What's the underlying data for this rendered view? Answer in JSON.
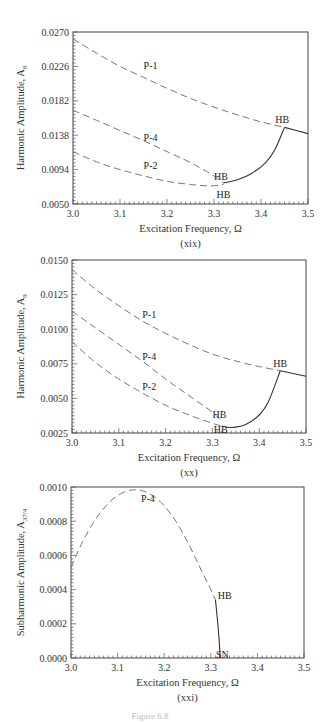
{
  "chart_data": [
    {
      "type": "line",
      "caption": "(xix)",
      "xlabel": "Excitation Frequency, Ω",
      "ylabel": "Harmonic Amplitude, A",
      "ylabel_sub": "8",
      "xlim": [
        3.0,
        3.5
      ],
      "ylim": [
        0.005,
        0.027
      ],
      "xticks": [
        "3.0",
        "3.1",
        "3.2",
        "3.3",
        "3.4",
        "3.5"
      ],
      "yticks": [
        "0.0270",
        "0.0226",
        "0.0182",
        "0.0138",
        "0.0094",
        "0.0050"
      ],
      "frame": {
        "x0": 73,
        "x1": 308,
        "y0": 32,
        "y1": 204
      },
      "series": [
        {
          "name": "P-1",
          "style": "dashed",
          "x": [
            3.0,
            3.05,
            3.1,
            3.15,
            3.2,
            3.25,
            3.3,
            3.35,
            3.4,
            3.45
          ],
          "y": [
            0.0261,
            0.0243,
            0.0226,
            0.0212,
            0.0198,
            0.0185,
            0.0174,
            0.0164,
            0.0155,
            0.0148
          ]
        },
        {
          "name": "P-1 stable",
          "style": "solid",
          "x": [
            3.45,
            3.5
          ],
          "y": [
            0.0148,
            0.014
          ]
        },
        {
          "name": "P-4",
          "style": "dashed",
          "x": [
            3.0,
            3.05,
            3.1,
            3.15,
            3.2,
            3.25,
            3.3,
            3.32
          ],
          "y": [
            0.017,
            0.0157,
            0.0144,
            0.0131,
            0.0117,
            0.0103,
            0.0086,
            0.0077
          ]
        },
        {
          "name": "P-2",
          "style": "dashed",
          "x": [
            3.0,
            3.05,
            3.1,
            3.15,
            3.2,
            3.25,
            3.29,
            3.32
          ],
          "y": [
            0.0117,
            0.0104,
            0.0094,
            0.0086,
            0.0079,
            0.0075,
            0.0073,
            0.0075
          ]
        },
        {
          "name": "stable branch",
          "style": "solid",
          "x": [
            3.32,
            3.35,
            3.38,
            3.41,
            3.43,
            3.45
          ],
          "y": [
            0.0077,
            0.0081,
            0.0089,
            0.0103,
            0.012,
            0.0148
          ]
        }
      ],
      "annotations": [
        {
          "text": "P-1",
          "x": 3.165,
          "y": 0.0226
        },
        {
          "text": "P-4",
          "x": 3.165,
          "y": 0.0135
        },
        {
          "text": "P-2",
          "x": 3.165,
          "y": 0.0098
        },
        {
          "text": "HB",
          "x": 3.445,
          "y": 0.0158
        },
        {
          "text": "HB",
          "x": 3.315,
          "y": 0.0085
        },
        {
          "text": "HB",
          "x": 3.32,
          "y": 0.0062
        }
      ]
    },
    {
      "type": "line",
      "caption": "(xx)",
      "xlabel": "Excitation Frequency, Ω",
      "ylabel": "Harmonic Amplitude, A",
      "ylabel_sub": "9",
      "xlim": [
        3.0,
        3.5
      ],
      "ylim": [
        0.0025,
        0.015
      ],
      "xticks": [
        "3.0",
        "3.1",
        "3.2",
        "3.3",
        "3.4",
        "3.5"
      ],
      "yticks": [
        "0.0150",
        "0.0125",
        "0.0100",
        "0.0075",
        "0.0050",
        "0.0025"
      ],
      "frame": {
        "x0": 72,
        "x1": 306,
        "y0": 260,
        "y1": 433
      },
      "series": [
        {
          "name": "P-1",
          "style": "dashed",
          "x": [
            3.0,
            3.05,
            3.1,
            3.15,
            3.2,
            3.25,
            3.3,
            3.35,
            3.4,
            3.445
          ],
          "y": [
            0.0143,
            0.0129,
            0.0117,
            0.0106,
            0.0097,
            0.0089,
            0.0082,
            0.0077,
            0.0073,
            0.007
          ]
        },
        {
          "name": "P-1 stable",
          "style": "solid",
          "x": [
            3.445,
            3.5
          ],
          "y": [
            0.007,
            0.0066
          ]
        },
        {
          "name": "P-4",
          "style": "dashed",
          "x": [
            3.0,
            3.05,
            3.1,
            3.15,
            3.2,
            3.25,
            3.3,
            3.32
          ],
          "y": [
            0.0113,
            0.0101,
            0.0089,
            0.0077,
            0.0064,
            0.0052,
            0.004,
            0.0033
          ]
        },
        {
          "name": "P-2",
          "style": "dashed",
          "x": [
            3.0,
            3.05,
            3.1,
            3.15,
            3.2,
            3.25,
            3.3,
            3.32
          ],
          "y": [
            0.0091,
            0.0076,
            0.0064,
            0.0054,
            0.0045,
            0.0038,
            0.0032,
            0.003
          ]
        },
        {
          "name": "stable branch",
          "style": "solid",
          "x": [
            3.32,
            3.34,
            3.37,
            3.4,
            3.42,
            3.445
          ],
          "y": [
            0.003,
            0.0029,
            0.0031,
            0.0038,
            0.0048,
            0.007
          ]
        }
      ],
      "annotations": [
        {
          "text": "P-1",
          "x": 3.165,
          "y": 0.011
        },
        {
          "text": "P-4",
          "x": 3.165,
          "y": 0.008
        },
        {
          "text": "P-2",
          "x": 3.165,
          "y": 0.0058
        },
        {
          "text": "HB",
          "x": 3.445,
          "y": 0.0075
        },
        {
          "text": "HB",
          "x": 3.315,
          "y": 0.0038
        },
        {
          "text": "HB",
          "x": 3.318,
          "y": 0.0027
        }
      ]
    },
    {
      "type": "line",
      "caption": "(xxi)",
      "xlabel": "Excitation Frequency, Ω",
      "ylabel": "Subharmonic Amplitude, A",
      "ylabel_sub": "37/4",
      "xlim": [
        3.0,
        3.5
      ],
      "ylim": [
        0.0,
        0.001
      ],
      "xticks": [
        "3.0",
        "3.1",
        "3.2",
        "3.3",
        "3.4",
        "3.5"
      ],
      "yticks": [
        "0.0010",
        "0.0008",
        "0.0006",
        "0.0004",
        "0.0002",
        "0.0000"
      ],
      "frame": {
        "x0": 71,
        "x1": 304,
        "y0": 487,
        "y1": 658
      },
      "series": [
        {
          "name": "P-4",
          "style": "dashed",
          "x": [
            3.0,
            3.025,
            3.05,
            3.075,
            3.1,
            3.125,
            3.15,
            3.175,
            3.2,
            3.225,
            3.25,
            3.275,
            3.3,
            3.31
          ],
          "y": [
            0.00053,
            0.00068,
            0.0008,
            0.00089,
            0.00095,
            0.00098,
            0.00098,
            0.00095,
            0.00089,
            0.0008,
            0.00068,
            0.00054,
            0.0004,
            0.00034
          ]
        },
        {
          "name": "P-4 stable",
          "style": "solid",
          "x": [
            3.31,
            3.315,
            3.318,
            3.32
          ],
          "y": [
            0.00034,
            0.0002,
            0.0001,
            0.0
          ]
        }
      ],
      "annotations": [
        {
          "text": "P-4",
          "x": 3.165,
          "y": 0.00093
        },
        {
          "text": "HB",
          "x": 3.33,
          "y": 0.00036
        },
        {
          "text": "SN",
          "x": 3.325,
          "y": 2e-05
        }
      ]
    }
  ],
  "figure_caption": "Figure 6.8"
}
